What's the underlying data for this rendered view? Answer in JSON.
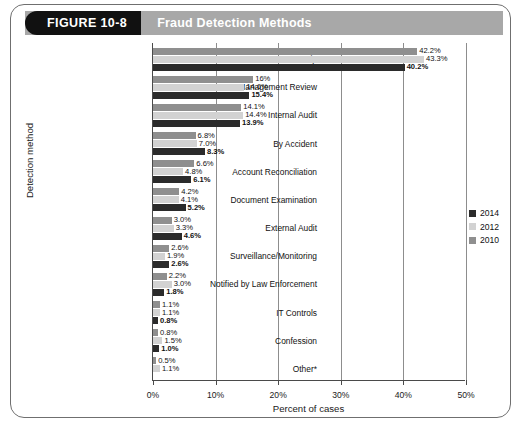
{
  "figure": {
    "tag": "FIGURE 10-8",
    "heading": "Fraud Detection Methods"
  },
  "legend": {
    "position": "right",
    "entries": [
      {
        "label": "2014",
        "color": "#2b2b2b"
      },
      {
        "label": "2012",
        "color": "#d2d2d2"
      },
      {
        "label": "2010",
        "color": "#8f8f8f"
      }
    ]
  },
  "chart_data": {
    "type": "bar",
    "orientation": "horizontal",
    "title": "Fraud Detection Methods",
    "xlabel": "Percent of cases",
    "ylabel": "Detection method",
    "xlim": [
      0,
      50
    ],
    "xticks": [
      0,
      10,
      20,
      30,
      40,
      50
    ],
    "xtick_labels": [
      "0%",
      "10%",
      "20%",
      "30%",
      "40%",
      "50%"
    ],
    "grid": "vertical",
    "unit": "%",
    "categories": [
      "Tip",
      "Management Review",
      "Internal Audit",
      "By Accident",
      "Account Reconciliation",
      "Document Examination",
      "External Audit",
      "Surveillance/Monitoring",
      "Notified by Law Enforcement",
      "IT Controls",
      "Confession",
      "Other*"
    ],
    "series": [
      {
        "name": "2010",
        "color": "#8f8f8f",
        "values": [
          42.2,
          16.0,
          14.1,
          6.8,
          6.6,
          4.2,
          3.0,
          2.6,
          2.2,
          1.1,
          0.8,
          0.5
        ],
        "labels": [
          "42.2%",
          "16%",
          "14.1%",
          "6.8%",
          "6.6%",
          "4.2%",
          "3.0%",
          "2.6%",
          "2.2%",
          "1.1%",
          "0.8%",
          "0.5%"
        ]
      },
      {
        "name": "2012",
        "color": "#d2d2d2",
        "values": [
          43.3,
          14.6,
          14.4,
          7.0,
          4.8,
          4.1,
          3.3,
          1.9,
          3.0,
          1.1,
          1.5,
          1.1
        ],
        "labels": [
          "43.3%",
          "14.6%",
          "14.4%",
          "7.0%",
          "4.8%",
          "4.1%",
          "3.3%",
          "1.9%",
          "3.0%",
          "1.1%",
          "1.5%",
          "1.1%"
        ]
      },
      {
        "name": "2014",
        "color": "#2b2b2b",
        "values": [
          40.2,
          15.4,
          13.9,
          8.3,
          6.1,
          5.2,
          4.6,
          2.6,
          1.8,
          0.8,
          1.0,
          null
        ],
        "labels": [
          "40.2%",
          "15.4%",
          "13.9%",
          "8.3%",
          "6.1%",
          "5.2%",
          "4.6%",
          "2.6%",
          "1.8%",
          "0.8%",
          "1.0%",
          ""
        ]
      }
    ]
  }
}
